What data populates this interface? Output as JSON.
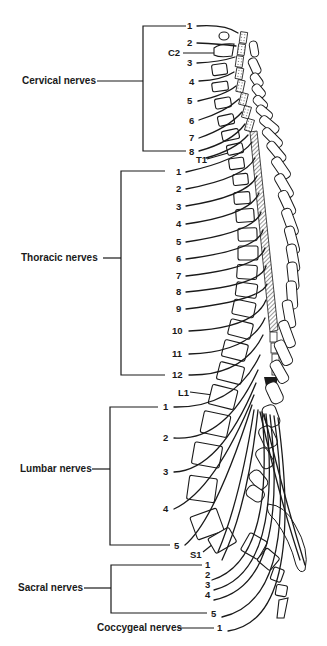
{
  "diagram": {
    "groups": [
      {
        "label": "Cervical nerves",
        "numbers": [
          "1",
          "2",
          "3",
          "4",
          "5",
          "6",
          "7",
          "8"
        ]
      },
      {
        "label": "Thoracic nerves",
        "numbers": [
          "1",
          "2",
          "3",
          "4",
          "5",
          "6",
          "7",
          "8",
          "9",
          "10",
          "11",
          "12"
        ]
      },
      {
        "label": "Lumbar nerves",
        "numbers": [
          "1",
          "2",
          "3",
          "4",
          "5"
        ]
      },
      {
        "label": "Sacral nerves",
        "numbers": [
          "1",
          "2",
          "3",
          "4",
          "5"
        ]
      },
      {
        "label": "Coccygeal nerves",
        "numbers": [
          "1"
        ]
      }
    ],
    "vertebra_markers": {
      "c2": "C2",
      "t1": "T1",
      "l1": "L1",
      "s1": "S1"
    },
    "colors": {
      "ink": "#1a1a1a",
      "background": "#ffffff"
    }
  }
}
